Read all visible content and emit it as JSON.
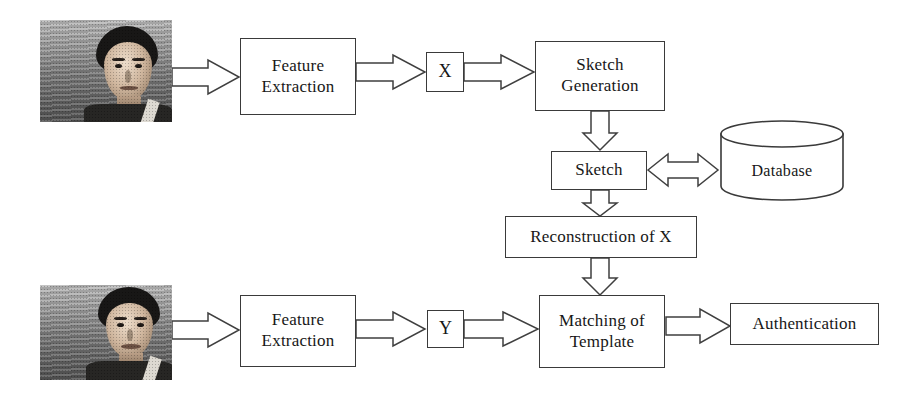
{
  "diagram": {
    "type": "flowchart",
    "stroke_color": "#3a3a3a",
    "fill_color": "#ffffff",
    "text_color": "#171717",
    "background_color": "#ffffff"
  },
  "nodes": {
    "input_photo_top": {
      "label": "",
      "kind": "image",
      "alt": "grayscale photograph of a man's face, probe image"
    },
    "feature_extraction_top": {
      "label": "Feature\nExtraction",
      "kind": "process"
    },
    "x_template": {
      "label": "X",
      "kind": "data"
    },
    "sketch_generation": {
      "label": "Sketch\nGeneration",
      "kind": "process"
    },
    "sketch": {
      "label": "Sketch",
      "kind": "data"
    },
    "database": {
      "label": "Database",
      "kind": "datastore"
    },
    "reconstruction_of_x": {
      "label": "Reconstruction of X",
      "kind": "process"
    },
    "input_photo_bottom": {
      "label": "",
      "kind": "image",
      "alt": "grayscale photograph of a man's face, gallery image"
    },
    "feature_extraction_bottom": {
      "label": "Feature\nExtraction",
      "kind": "process"
    },
    "y_template": {
      "label": "Y",
      "kind": "data"
    },
    "matching_of_template": {
      "label": "Matching of\nTemplate",
      "kind": "process"
    },
    "authentication": {
      "label": "Authentication",
      "kind": "terminal"
    }
  },
  "edges": [
    {
      "from": "input_photo_top",
      "to": "feature_extraction_top",
      "direction": "right",
      "style": "block-arrow"
    },
    {
      "from": "feature_extraction_top",
      "to": "x_template",
      "direction": "right",
      "style": "block-arrow"
    },
    {
      "from": "x_template",
      "to": "sketch_generation",
      "direction": "right",
      "style": "block-arrow"
    },
    {
      "from": "sketch_generation",
      "to": "sketch",
      "direction": "down",
      "style": "block-arrow"
    },
    {
      "from": "sketch",
      "to": "database",
      "direction": "both",
      "style": "block-arrow-double"
    },
    {
      "from": "sketch",
      "to": "reconstruction_of_x",
      "direction": "down",
      "style": "block-arrow"
    },
    {
      "from": "reconstruction_of_x",
      "to": "matching_of_template",
      "direction": "down",
      "style": "block-arrow"
    },
    {
      "from": "input_photo_bottom",
      "to": "feature_extraction_bottom",
      "direction": "right",
      "style": "block-arrow"
    },
    {
      "from": "feature_extraction_bottom",
      "to": "y_template",
      "direction": "right",
      "style": "block-arrow"
    },
    {
      "from": "y_template",
      "to": "matching_of_template",
      "direction": "right",
      "style": "block-arrow"
    },
    {
      "from": "matching_of_template",
      "to": "authentication",
      "direction": "right",
      "style": "block-arrow"
    }
  ]
}
